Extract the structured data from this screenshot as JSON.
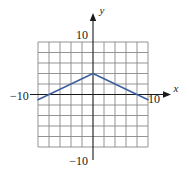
{
  "figure": {
    "name": "coordinate-plane-graph",
    "background": "#ffffff",
    "axis_color": "#1a1a1a",
    "grid_color": "#888888",
    "curve_color": "#3c5f9e"
  },
  "axes": {
    "x_axis_label": "x",
    "y_axis_label": "y",
    "x_tick_left_label": "−10",
    "x_tick_right_label": "10",
    "y_tick_top_label": "10",
    "y_tick_bottom_label": "−10"
  },
  "chart_data": {
    "type": "line",
    "title": "",
    "xlabel": "x",
    "ylabel": "y",
    "xlim": [
      -10,
      10
    ],
    "ylim": [
      -10,
      10
    ],
    "xticks": [
      -10,
      10
    ],
    "yticks": [
      -10,
      10
    ],
    "xtick_labels": [
      "−10",
      "10"
    ],
    "ytick_labels": [
      "−10",
      "10"
    ],
    "grid": true,
    "grid_step": 2,
    "legend": "none",
    "series": [
      {
        "name": "piecewise-linear-tent",
        "color": "#3c5f9e",
        "x": [
          -10,
          0,
          10
        ],
        "y": [
          -1,
          4,
          -1
        ]
      }
    ],
    "annotations": []
  }
}
